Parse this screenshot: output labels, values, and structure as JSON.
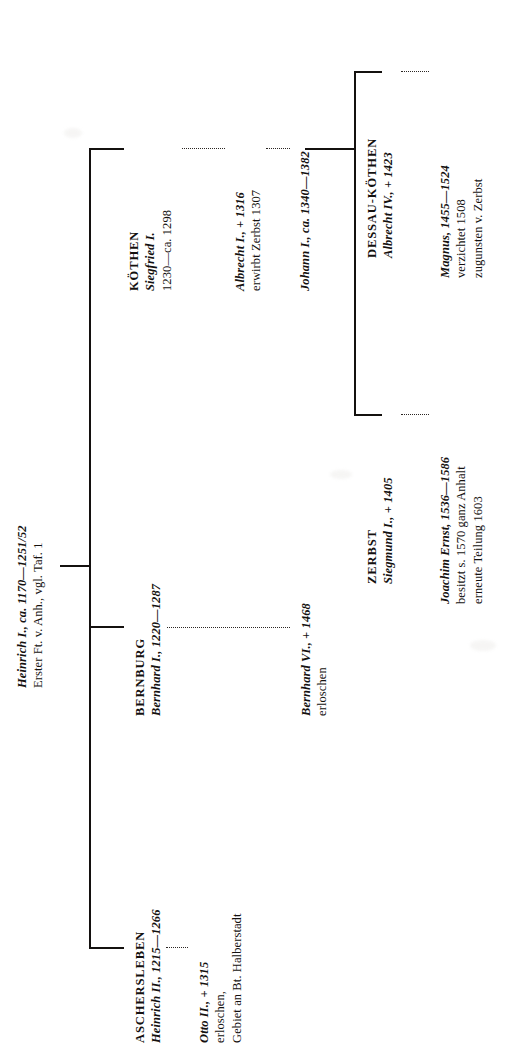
{
  "document": {
    "kind": "genealogical-table",
    "orientation": "rotated-90-ccw",
    "ink_color": "#14110f",
    "page_color": "#ffffff"
  },
  "root": {
    "line1": "Heinrich I., ca. 1170—1251/52",
    "line2": "Erster Ft. v. Anh., vgl. Taf. 1"
  },
  "branches": {
    "aschersleben": {
      "house": "ASCHERSLEBEN",
      "holder": "Heinrich II., 1215—1266",
      "successor_line1": "Otto II., + 1315",
      "successor_line2": "erloschen,",
      "successor_line3": "Gebiet an Bt. Halberstadt"
    },
    "bernburg": {
      "house": "BERNBURG",
      "holder": "Bernhard I., 1220—1287",
      "successor_line1": "Bernhard VI., + 1468",
      "successor_line2": "erloschen"
    },
    "koethen": {
      "house": "KÖTHEN",
      "holder_line1": "Siegfried I.",
      "holder_line2": "1230—ca. 1298",
      "gen2_line1": "Albrecht I., + 1316",
      "gen2_line2": "erwirbt Zerbst 1307",
      "gen3_line1": "Johann I., ca. 1340—1382"
    },
    "zerbst": {
      "house": "ZERBST",
      "holder": "Siegmund I., + 1405",
      "successor_line1": "Joachim Ernst, 1536—1586",
      "successor_line2": "besitzt s. 1570 ganz Anhalt",
      "successor_line3": "erneute Teilung 1603"
    },
    "dessau_koethen": {
      "house": "DESSAU-KÖTHEN",
      "holder": "Albrecht IV., + 1423",
      "successor_line1": "Magnus, 1455—1524",
      "successor_line2": "verzichtet 1508",
      "successor_line3": "zugunsten v. Zerbst"
    }
  }
}
